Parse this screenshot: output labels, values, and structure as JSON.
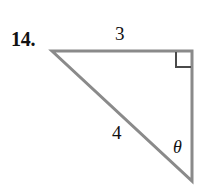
{
  "figure": {
    "problem_number": "14.",
    "type": "right-triangle-diagram",
    "stroke_color": "#8a8a8a",
    "label_color": "#111111",
    "background_color": "#ffffff",
    "stroke_width": 3,
    "vertices": {
      "top_left": [
        52,
        51
      ],
      "top_right": [
        192,
        51
      ],
      "bottom_right": [
        192,
        181
      ]
    },
    "sides": [
      {
        "name": "top-leg",
        "label": "3",
        "from": "top_left",
        "to": "top_right"
      },
      {
        "name": "hypotenuse",
        "label": "4",
        "from": "top_left",
        "to": "bottom_right"
      },
      {
        "name": "right-leg",
        "label": "",
        "from": "top_right",
        "to": "bottom_right"
      }
    ],
    "labels": {
      "side_top": "3",
      "side_hypotenuse": "4",
      "angle": "θ"
    },
    "right_angle_marker": {
      "at_vertex": "top_right",
      "size": 16
    },
    "angle_marker": {
      "at_vertex": "bottom_right",
      "symbol": "θ"
    }
  }
}
